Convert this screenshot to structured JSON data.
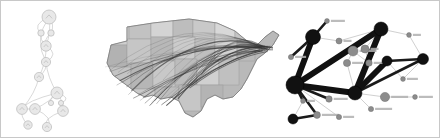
{
  "figure": {
    "background_color": "#ffffff",
    "border_color": "#c8c8c8",
    "width": 440,
    "height": 138,
    "panel_count": 3
  },
  "panels": [
    {
      "id": "dag",
      "name": "Directed acyclic graph / flowchart",
      "type": "node-link-diagram",
      "style": "faint light-gray outlined circular nodes with thin curved directed edges",
      "node_color": "#e8e8e8",
      "node_stroke": "#b9b9b9",
      "edge_color": "#c9c9c9",
      "node_count": 14,
      "edge_count": 20
    },
    {
      "id": "map",
      "name": "United States flight-route map",
      "type": "geographic-flow-map",
      "style": "grayscale choropleth state polygons overlaid with bundled great-circle route arcs",
      "land_color": "#b4b4b4",
      "land_stroke": "#8f8f8f",
      "arc_color": "#3a3a3a",
      "arc_count": 34,
      "region": "Contiguous United States"
    },
    {
      "id": "network",
      "name": "Weighted node-link network graph",
      "type": "node-link-diagram",
      "style": "black hub nodes with very thick black triangle edges, gray secondary nodes and thin light edges, tiny unreadable labels",
      "hub_color": "#111111",
      "secondary_color": "#8c8c8c",
      "thin_edge_color": "#bcbcbc",
      "thick_edge_color": "#111111",
      "hub_count": 7,
      "secondary_count": 16,
      "highlight_shape": "triangle"
    }
  ],
  "graph_data": {
    "dag": {
      "nodes": [
        {
          "id": "n0",
          "x": 48,
          "y": 16,
          "r": 7.0
        },
        {
          "id": "n1",
          "x": 40,
          "y": 32,
          "r": 3.2
        },
        {
          "id": "n2",
          "x": 50,
          "y": 32,
          "r": 3.2
        },
        {
          "id": "n3",
          "x": 45,
          "y": 45,
          "r": 5.2
        },
        {
          "id": "n4",
          "x": 45,
          "y": 61,
          "r": 4.6
        },
        {
          "id": "n5",
          "x": 38,
          "y": 76,
          "r": 4.6
        },
        {
          "id": "n6",
          "x": 56,
          "y": 92,
          "r": 6.0
        },
        {
          "id": "n7",
          "x": 50,
          "y": 102,
          "r": 2.6
        },
        {
          "id": "n8",
          "x": 60,
          "y": 102,
          "r": 2.6
        },
        {
          "id": "n9",
          "x": 21,
          "y": 108,
          "r": 5.4
        },
        {
          "id": "n10",
          "x": 34,
          "y": 108,
          "r": 5.4
        },
        {
          "id": "n11",
          "x": 62,
          "y": 110,
          "r": 5.4
        },
        {
          "id": "n12",
          "x": 27,
          "y": 124,
          "r": 4.2
        },
        {
          "id": "n13",
          "x": 46,
          "y": 126,
          "r": 4.6
        }
      ],
      "edges": [
        [
          "n0",
          "n1"
        ],
        [
          "n0",
          "n2"
        ],
        [
          "n0",
          "n3"
        ],
        [
          "n1",
          "n3"
        ],
        [
          "n2",
          "n3"
        ],
        [
          "n3",
          "n4"
        ],
        [
          "n0",
          "n4"
        ],
        [
          "n4",
          "n5"
        ],
        [
          "n3",
          "n5"
        ],
        [
          "n4",
          "n6"
        ],
        [
          "n6",
          "n7"
        ],
        [
          "n6",
          "n8"
        ],
        [
          "n6",
          "n9"
        ],
        [
          "n6",
          "n10"
        ],
        [
          "n6",
          "n11"
        ],
        [
          "n9",
          "n10"
        ],
        [
          "n9",
          "n12"
        ],
        [
          "n10",
          "n13"
        ],
        [
          "n11",
          "n13"
        ],
        [
          "n5",
          "n9"
        ]
      ]
    },
    "network": {
      "nodes": [
        {
          "id": "h1",
          "x": 30,
          "y": 36,
          "r": 7.5,
          "kind": "hub"
        },
        {
          "id": "h2",
          "x": 98,
          "y": 28,
          "r": 7.0,
          "kind": "hub"
        },
        {
          "id": "h3",
          "x": 72,
          "y": 92,
          "r": 7.0,
          "kind": "hub"
        },
        {
          "id": "h4",
          "x": 12,
          "y": 84,
          "r": 9.0,
          "kind": "hub"
        },
        {
          "id": "h5",
          "x": 104,
          "y": 60,
          "r": 5.0,
          "kind": "hub"
        },
        {
          "id": "h6",
          "x": 140,
          "y": 58,
          "r": 5.5,
          "kind": "hub"
        },
        {
          "id": "h7",
          "x": 10,
          "y": 118,
          "r": 5.0,
          "kind": "hub"
        },
        {
          "id": "s1",
          "x": 70,
          "y": 50,
          "r": 5.0,
          "kind": "secondary"
        },
        {
          "id": "s2",
          "x": 82,
          "y": 48,
          "r": 4.0,
          "kind": "secondary"
        },
        {
          "id": "s3",
          "x": 64,
          "y": 62,
          "r": 3.6,
          "kind": "secondary"
        },
        {
          "id": "s4",
          "x": 86,
          "y": 62,
          "r": 3.2,
          "kind": "secondary"
        },
        {
          "id": "s5",
          "x": 102,
          "y": 96,
          "r": 4.6,
          "kind": "secondary"
        },
        {
          "id": "s6",
          "x": 56,
          "y": 40,
          "r": 3.0,
          "kind": "secondary"
        },
        {
          "id": "s7",
          "x": 8,
          "y": 56,
          "r": 2.6,
          "kind": "secondary"
        },
        {
          "id": "s8",
          "x": 46,
          "y": 98,
          "r": 3.2,
          "kind": "secondary"
        },
        {
          "id": "s9",
          "x": 34,
          "y": 114,
          "r": 3.4,
          "kind": "secondary"
        },
        {
          "id": "s10",
          "x": 126,
          "y": 34,
          "r": 2.4,
          "kind": "secondary"
        },
        {
          "id": "s11",
          "x": 120,
          "y": 78,
          "r": 2.4,
          "kind": "secondary"
        },
        {
          "id": "s12",
          "x": 44,
          "y": 20,
          "r": 2.4,
          "kind": "secondary"
        },
        {
          "id": "s13",
          "x": 88,
          "y": 108,
          "r": 2.6,
          "kind": "secondary"
        },
        {
          "id": "s14",
          "x": 20,
          "y": 100,
          "r": 2.4,
          "kind": "secondary"
        },
        {
          "id": "s15",
          "x": 56,
          "y": 116,
          "r": 2.6,
          "kind": "secondary"
        },
        {
          "id": "s16",
          "x": 132,
          "y": 96,
          "r": 2.4,
          "kind": "secondary"
        }
      ],
      "thick_edges": [
        [
          "h2",
          "h3"
        ],
        [
          "h3",
          "h4"
        ],
        [
          "h4",
          "h2"
        ],
        [
          "h1",
          "h4"
        ],
        [
          "h3",
          "h5"
        ]
      ],
      "medium_edges": [
        [
          "h5",
          "h6"
        ],
        [
          "h3",
          "h6"
        ],
        [
          "h4",
          "s8"
        ],
        [
          "h4",
          "s9"
        ],
        [
          "h4",
          "s14"
        ],
        [
          "h7",
          "s9"
        ],
        [
          "h1",
          "s7"
        ],
        [
          "h1",
          "s12"
        ]
      ],
      "thin_edges": [
        [
          "h2",
          "s1"
        ],
        [
          "h2",
          "s2"
        ],
        [
          "h2",
          "s6"
        ],
        [
          "s1",
          "s3"
        ],
        [
          "s1",
          "s4"
        ],
        [
          "s2",
          "s4"
        ],
        [
          "h3",
          "s5"
        ],
        [
          "h3",
          "s13"
        ],
        [
          "h6",
          "s10"
        ],
        [
          "h6",
          "s11"
        ],
        [
          "h5",
          "s11"
        ],
        [
          "h4",
          "s15"
        ],
        [
          "s5",
          "s16"
        ],
        [
          "h2",
          "s10"
        ],
        [
          "s3",
          "h3"
        ],
        [
          "s4",
          "h3"
        ],
        [
          "h1",
          "s6"
        ],
        [
          "h7",
          "s14"
        ]
      ]
    }
  },
  "map_data": {
    "arcs_description": "Bundled origin-destination flight arcs converging on the Northeast corridor",
    "arc_anchor_east": {
      "x": 163,
      "y": 48
    },
    "arc_anchor_west": {
      "x": 8,
      "y": 66
    },
    "arc_count": 34
  }
}
